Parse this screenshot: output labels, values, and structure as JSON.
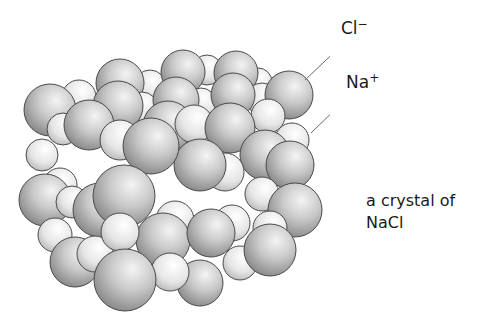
{
  "diagram": {
    "title": "a crystal of NaCl",
    "labels": {
      "chloride": {
        "symbol": "Cl",
        "charge": "−",
        "description": "chloride ion (large sphere)"
      },
      "sodium": {
        "symbol": "Na",
        "charge": "+",
        "description": "sodium ion (small sphere)"
      }
    },
    "caption": {
      "line1": "a crystal of",
      "line2": "NaCl"
    },
    "colors": {
      "background": "#ffffff",
      "sphere_outline": "#4a4a4a",
      "cl_fill_light": "#f2f2f2",
      "cl_fill_dark": "#8a8a8a",
      "na_fill_light": "#ffffff",
      "na_fill_dark": "#b4b4b4",
      "leader_line": "#6a6a6a",
      "text": "#1a1a1a"
    },
    "spheres": [
      {
        "ion": "na",
        "x": 150,
        "y": 86,
        "r": 16
      },
      {
        "ion": "na",
        "x": 207,
        "y": 70,
        "r": 15
      },
      {
        "ion": "na",
        "x": 258,
        "y": 82,
        "r": 14
      },
      {
        "ion": "cl",
        "x": 120,
        "y": 83,
        "r": 24
      },
      {
        "ion": "cl",
        "x": 183,
        "y": 72,
        "r": 22
      },
      {
        "ion": "cl",
        "x": 236,
        "y": 73,
        "r": 22
      },
      {
        "ion": "na",
        "x": 79,
        "y": 97,
        "r": 17
      },
      {
        "ion": "na",
        "x": 142,
        "y": 108,
        "r": 16
      },
      {
        "ion": "na",
        "x": 201,
        "y": 103,
        "r": 15
      },
      {
        "ion": "na",
        "x": 262,
        "y": 99,
        "r": 16
      },
      {
        "ion": "cl",
        "x": 50,
        "y": 110,
        "r": 26
      },
      {
        "ion": "cl",
        "x": 118,
        "y": 106,
        "r": 25
      },
      {
        "ion": "cl",
        "x": 176,
        "y": 100,
        "r": 23
      },
      {
        "ion": "cl",
        "x": 233,
        "y": 95,
        "r": 22
      },
      {
        "ion": "cl",
        "x": 289,
        "y": 95,
        "r": 24
      },
      {
        "ion": "na",
        "x": 63,
        "y": 129,
        "r": 16
      },
      {
        "ion": "na",
        "x": 268,
        "y": 116,
        "r": 17
      },
      {
        "ion": "na",
        "x": 292,
        "y": 140,
        "r": 17
      },
      {
        "ion": "na",
        "x": 42,
        "y": 155,
        "r": 16
      },
      {
        "ion": "cl",
        "x": 89,
        "y": 125,
        "r": 25
      },
      {
        "ion": "cl",
        "x": 168,
        "y": 126,
        "r": 25
      },
      {
        "ion": "na",
        "x": 194,
        "y": 124,
        "r": 19
      },
      {
        "ion": "cl",
        "x": 230,
        "y": 128,
        "r": 25
      },
      {
        "ion": "cl",
        "x": 265,
        "y": 155,
        "r": 25
      },
      {
        "ion": "cl",
        "x": 290,
        "y": 165,
        "r": 24
      },
      {
        "ion": "na",
        "x": 225,
        "y": 172,
        "r": 19
      },
      {
        "ion": "na",
        "x": 262,
        "y": 194,
        "r": 17
      },
      {
        "ion": "cl",
        "x": 200,
        "y": 165,
        "r": 26
      },
      {
        "ion": "na",
        "x": 120,
        "y": 140,
        "r": 20
      },
      {
        "ion": "cl",
        "x": 151,
        "y": 146,
        "r": 28
      },
      {
        "ion": "na",
        "x": 60,
        "y": 185,
        "r": 17
      },
      {
        "ion": "cl",
        "x": 45,
        "y": 200,
        "r": 26
      },
      {
        "ion": "na",
        "x": 72,
        "y": 202,
        "r": 16
      },
      {
        "ion": "cl",
        "x": 100,
        "y": 210,
        "r": 27
      },
      {
        "ion": "cl",
        "x": 124,
        "y": 196,
        "r": 31
      },
      {
        "ion": "cl",
        "x": 295,
        "y": 210,
        "r": 27
      },
      {
        "ion": "na",
        "x": 232,
        "y": 223,
        "r": 18
      },
      {
        "ion": "na",
        "x": 270,
        "y": 228,
        "r": 17
      },
      {
        "ion": "na",
        "x": 175,
        "y": 220,
        "r": 19
      },
      {
        "ion": "cl",
        "x": 163,
        "y": 240,
        "r": 27
      },
      {
        "ion": "cl",
        "x": 211,
        "y": 233,
        "r": 24
      },
      {
        "ion": "na",
        "x": 55,
        "y": 235,
        "r": 17
      },
      {
        "ion": "cl",
        "x": 75,
        "y": 262,
        "r": 25
      },
      {
        "ion": "na",
        "x": 95,
        "y": 254,
        "r": 18
      },
      {
        "ion": "na",
        "x": 120,
        "y": 232,
        "r": 19
      },
      {
        "ion": "cl",
        "x": 200,
        "y": 283,
        "r": 23
      },
      {
        "ion": "na",
        "x": 170,
        "y": 272,
        "r": 19
      },
      {
        "ion": "na",
        "x": 240,
        "y": 263,
        "r": 17
      },
      {
        "ion": "cl",
        "x": 270,
        "y": 250,
        "r": 26
      },
      {
        "ion": "cl",
        "x": 125,
        "y": 280,
        "r": 31
      }
    ]
  }
}
